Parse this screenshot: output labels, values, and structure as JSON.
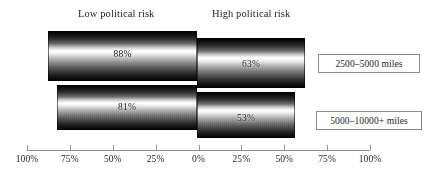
{
  "chart_data": {
    "type": "bar",
    "orientation": "horizontal",
    "subtype": "diverging-bidirectional",
    "title": "",
    "xlabel": "",
    "ylabel": "",
    "grid": false,
    "legend_position": "right",
    "headers": {
      "left": "Low political risk",
      "right": "High political risk"
    },
    "categories": [
      "2500–5000 miles",
      "5000–10000+ miles"
    ],
    "series": [
      {
        "name": "Low political risk",
        "values": [
          88,
          63
        ]
      },
      {
        "name": "High political risk",
        "values": [
          81,
          53
        ]
      }
    ],
    "points": [
      {
        "category": "2500–5000 miles",
        "side": "left",
        "value": 88,
        "label": "88%"
      },
      {
        "category": "2500–5000 miles",
        "side": "right",
        "value": 63,
        "label": "63%"
      },
      {
        "category": "5000–10000+ miles",
        "side": "left",
        "value": 81,
        "label": "81%"
      },
      {
        "category": "5000–10000+ miles",
        "side": "right",
        "value": 53,
        "label": "53%"
      }
    ],
    "xlim": [
      -100,
      100
    ],
    "axis_ticks": [
      {
        "label": "100%",
        "value": -100
      },
      {
        "label": "75%",
        "value": -75
      },
      {
        "label": "50%",
        "value": -50
      },
      {
        "label": "25%",
        "value": -25
      },
      {
        "label": "0%",
        "value": 0
      },
      {
        "label": "25%",
        "value": 25
      },
      {
        "label": "50%",
        "value": 50
      },
      {
        "label": "75%",
        "value": 75
      },
      {
        "label": "100%",
        "value": 100
      }
    ]
  },
  "colors": {
    "bar_dark": "#000000",
    "bar_highlight": "#ffffff",
    "axis": "#8f8f8f",
    "legend_border": "#8a8a8a",
    "text": "#1a1a1a",
    "background": "#ffffff"
  }
}
